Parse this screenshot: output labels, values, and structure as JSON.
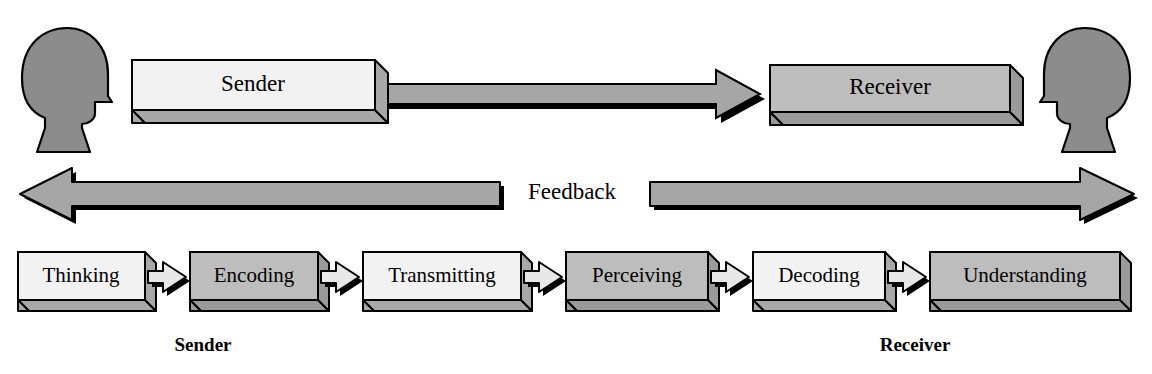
{
  "diagram": {
    "colors": {
      "outline": "#000000",
      "head_fill": "#8c8c8c",
      "box_light_face": "#f2f2f2",
      "box_light_side": "#a8a8a8",
      "box_dark_face": "#bdbdbd",
      "box_dark_side": "#9a9a9a",
      "arrow_fill": "#a6a6a6",
      "arrow_shadow": "#000000",
      "connector_fill": "#e8e8e8",
      "background": "#ffffff"
    },
    "top_row": {
      "left_head": {
        "name": "sender-head",
        "facing": "right"
      },
      "right_head": {
        "name": "receiver-head",
        "facing": "left"
      },
      "sender_box": {
        "label": "Sender",
        "shade": "light"
      },
      "receiver_box": {
        "label": "Receiver",
        "shade": "dark"
      },
      "message_arrow": {
        "name": "message-arrow",
        "direction": "right"
      }
    },
    "feedback_row": {
      "label": "Feedback",
      "left_arrow_direction": "left",
      "right_arrow_direction": "right"
    },
    "process_chain": {
      "steps": [
        {
          "label": "Thinking",
          "shade": "light"
        },
        {
          "label": "Encoding",
          "shade": "dark"
        },
        {
          "label": "Transmitting",
          "shade": "light"
        },
        {
          "label": "Perceiving",
          "shade": "dark"
        },
        {
          "label": "Decoding",
          "shade": "light"
        },
        {
          "label": "Understanding",
          "shade": "dark"
        }
      ],
      "connector_count": 5
    },
    "role_labels": {
      "sender": "Sender",
      "receiver": "Receiver"
    }
  }
}
